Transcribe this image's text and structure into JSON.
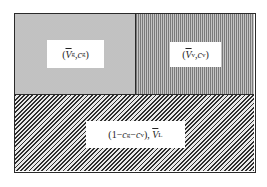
{
  "diagram": {
    "type": "phase-region-diagram",
    "regions": [
      {
        "id": "gas",
        "label": "⟨V̄g, cg⟩",
        "label_parts": {
          "open": "(",
          "var": "V",
          "var_sub": "g",
          "sep": ",",
          "conc": "c",
          "conc_sub": "g",
          "close": ")"
        },
        "fill": "dotted-light",
        "color": "#e4e4e4"
      },
      {
        "id": "vapor",
        "label": "⟨V̄v, cv⟩",
        "label_parts": {
          "open": "(",
          "var": "V",
          "var_sub": "v",
          "sep": ",",
          "conc": "c",
          "conc_sub": "v",
          "close": ")"
        },
        "fill": "vertical-lines",
        "color": "#a8a8a8"
      },
      {
        "id": "liquid",
        "label": "(1−cg−cv), V̄L",
        "label_parts": {
          "prefix": "(1−",
          "c1": "c",
          "c1_sub": "g",
          "minus": "−",
          "c2": "c",
          "c2_sub": "v",
          "close": "), ",
          "var": "V",
          "var_sub": "L"
        },
        "fill": "diagonal-hatch",
        "color": "#d8d8d8"
      }
    ],
    "border_color": "#2a2a2a"
  }
}
